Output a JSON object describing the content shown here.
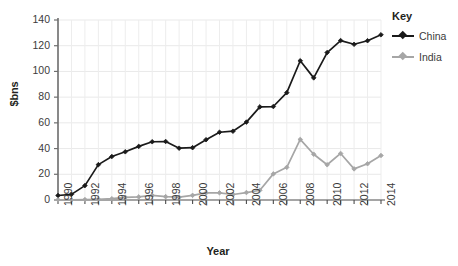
{
  "chart_data": {
    "type": "line",
    "title": "",
    "xlabel": "Year",
    "ylabel": "$bns",
    "ylim": [
      0,
      140
    ],
    "ytick_step": 20,
    "yticks": [
      "0",
      "20",
      "40",
      "60",
      "80",
      "100",
      "120",
      "140"
    ],
    "grid": true,
    "legend_position": "right",
    "legend_title": "Key",
    "x": [
      1990,
      1991,
      1992,
      1993,
      1994,
      1995,
      1996,
      1997,
      1998,
      1999,
      2000,
      2001,
      2002,
      2003,
      2004,
      2005,
      2006,
      2007,
      2008,
      2009,
      2010,
      2011,
      2012,
      2013,
      2014
    ],
    "xticks_shown": [
      "1990",
      "1992",
      "1994",
      "1996",
      "1998",
      "2000",
      "2002",
      "2004",
      "2006",
      "2008",
      "2010",
      "2012",
      "2014"
    ],
    "series": [
      {
        "name": "China",
        "color": "#1a1a1a",
        "marker": "diamond",
        "values": [
          3.5,
          4.4,
          11.2,
          27.5,
          33.8,
          37.5,
          41.7,
          45.3,
          45.5,
          40.3,
          40.7,
          46.9,
          52.7,
          53.5,
          60.6,
          72.4,
          72.7,
          83.5,
          108.3,
          95.0,
          114.7,
          124.0,
          121.1,
          123.9,
          128.5
        ]
      },
      {
        "name": "India",
        "color": "#a6a6a6",
        "marker": "diamond",
        "values": [
          0.2,
          0.1,
          0.3,
          0.6,
          1.0,
          2.1,
          2.4,
          3.6,
          2.6,
          2.2,
          3.6,
          5.5,
          5.6,
          4.3,
          5.8,
          7.6,
          20.3,
          25.4,
          47.1,
          35.6,
          27.4,
          36.2,
          24.2,
          28.2,
          34.6
        ]
      }
    ]
  }
}
